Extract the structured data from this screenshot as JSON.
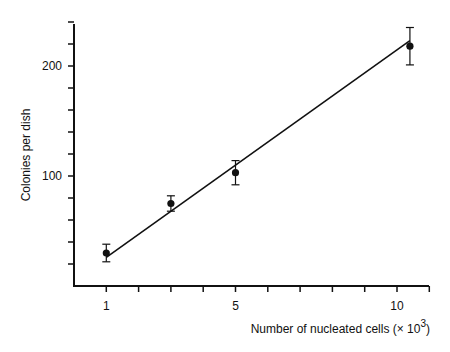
{
  "chart_data": {
    "type": "scatter",
    "title": "",
    "xlabel": "Number of nucleated cells (× 10³)",
    "xlabel_main": "Number of nucleated cells (",
    "xlabel_times": "× 10",
    "xlabel_sup": "3",
    "xlabel_close": ")",
    "ylabel": "Colonies per dish",
    "xlim": [
      0,
      11
    ],
    "ylim": [
      0,
      240
    ],
    "x_tick_labels": [
      "1",
      "5",
      "10"
    ],
    "y_tick_labels": [
      "100",
      "200"
    ],
    "grid": false,
    "legend": null,
    "points": [
      {
        "x": 1,
        "y": 30,
        "err": 8
      },
      {
        "x": 3,
        "y": 75,
        "err": 7
      },
      {
        "x": 5,
        "y": 103,
        "err": 11
      },
      {
        "x": 10.4,
        "y": 218,
        "err": 17
      }
    ],
    "fit_line": {
      "x1": 1,
      "y1": 26,
      "x2": 10.4,
      "y2": 223
    }
  }
}
